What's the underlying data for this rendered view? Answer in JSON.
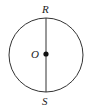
{
  "diagram": {
    "type": "geometry",
    "labels": {
      "top": "R",
      "center": "O",
      "bottom": "S"
    },
    "colors": {
      "stroke": "#333333",
      "text": "#222222",
      "background": "#ffffff"
    }
  }
}
